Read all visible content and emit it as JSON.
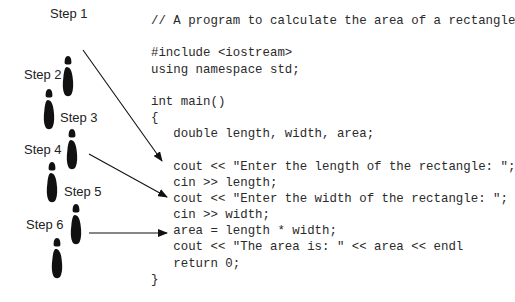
{
  "code": {
    "comment": "// A program to calculate the area of a rectangle",
    "include": "#include <iostream>",
    "using": "using namespace std;",
    "main_sig": "int main()",
    "open_brace": "{",
    "decl": "   double length, width, area;",
    "prompt_length": "   cout << \"Enter the length of the rectangle: \";",
    "read_length": "   cin >> length;",
    "prompt_width": "   cout << \"Enter the width of the rectangle: \";",
    "read_width": "   cin >> width;",
    "compute": "   area = length * width;",
    "output": "   cout << \"The area is: \" << area << endl",
    "return": "   return 0;",
    "close_brace": "}"
  },
  "steps": [
    {
      "label": "Step 1"
    },
    {
      "label": "Step 2"
    },
    {
      "label": "Step 3"
    },
    {
      "label": "Step 4"
    },
    {
      "label": "Step 5"
    },
    {
      "label": "Step 6"
    }
  ],
  "colors": {
    "ink": "#111111",
    "text": "#2a2a2a"
  }
}
